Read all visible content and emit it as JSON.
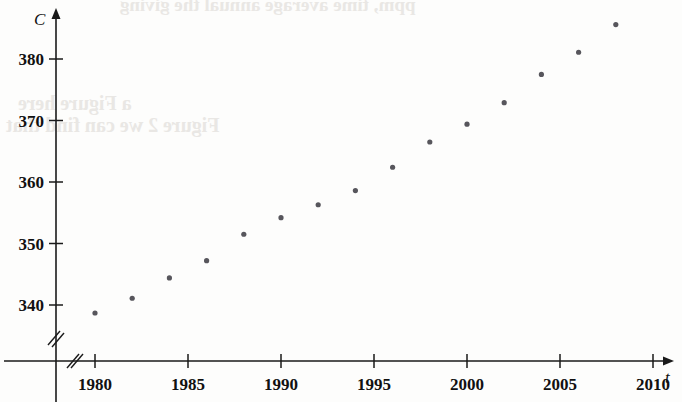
{
  "figure": {
    "background_color": "#fdfdfc",
    "ink_color": "#1a1a1a",
    "marker_color": "#57565c"
  },
  "bleed_through": {
    "line_top": "ppm, time average annual the giving",
    "line_1": "a Figure here",
    "line_2": "Figure 2 we can find that"
  },
  "chart_data": {
    "type": "scatter",
    "title": "",
    "xlabel": "t",
    "ylabel": "C",
    "xlim": [
      1978,
      2011
    ],
    "ylim": [
      335,
      388
    ],
    "grid": false,
    "legend": null,
    "x_axis_break": true,
    "y_axis_break": true,
    "x_ticks": [
      1980,
      1985,
      1990,
      1995,
      2000,
      2005,
      2010
    ],
    "x_tick_labels": [
      "1980",
      "1985",
      "1990",
      "1995",
      "2000",
      "2005",
      "2010"
    ],
    "y_ticks": [
      340,
      350,
      360,
      370,
      380
    ],
    "y_tick_labels": [
      "340",
      "350",
      "360",
      "370",
      "380"
    ],
    "x": [
      1980,
      1982,
      1984,
      1986,
      1988,
      1990,
      1992,
      1994,
      1996,
      1998,
      2000,
      2002,
      2004,
      2006,
      2008
    ],
    "values": [
      338.7,
      341.1,
      344.4,
      347.2,
      351.5,
      354.2,
      356.3,
      358.6,
      362.4,
      366.5,
      369.4,
      372.9,
      377.5,
      381.1,
      385.6
    ],
    "series": [
      {
        "name": "C",
        "points": [
          {
            "t": 1980,
            "c": 338.7
          },
          {
            "t": 1982,
            "c": 341.1
          },
          {
            "t": 1984,
            "c": 344.4
          },
          {
            "t": 1986,
            "c": 347.2
          },
          {
            "t": 1988,
            "c": 351.5
          },
          {
            "t": 1990,
            "c": 354.2
          },
          {
            "t": 1992,
            "c": 356.3
          },
          {
            "t": 1994,
            "c": 358.6
          },
          {
            "t": 1996,
            "c": 362.4
          },
          {
            "t": 1998,
            "c": 366.5
          },
          {
            "t": 2000,
            "c": 369.4
          },
          {
            "t": 2002,
            "c": 372.9
          },
          {
            "t": 2004,
            "c": 377.5
          },
          {
            "t": 2006,
            "c": 381.1
          },
          {
            "t": 2008,
            "c": 385.6
          }
        ]
      }
    ]
  }
}
